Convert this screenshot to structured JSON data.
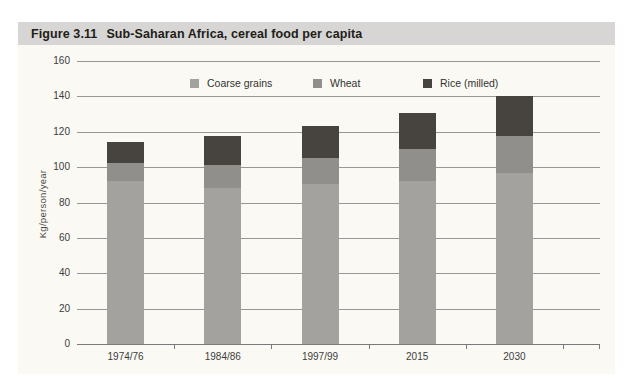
{
  "figure": {
    "label": "Figure 3.11",
    "title": "Sub-Saharan Africa, cereal food per capita"
  },
  "chart_data": {
    "type": "bar",
    "stacked": true,
    "title": "Sub-Saharan Africa, cereal food per capita",
    "xlabel": "",
    "ylabel": "Kg/person/year",
    "ylim": [
      0,
      160
    ],
    "ytick_step": 20,
    "grid": true,
    "legend_position": "top-center",
    "categories": [
      "1974/76",
      "1984/86",
      "1997/99",
      "2015",
      "2030"
    ],
    "series": [
      {
        "name": "Coarse grains",
        "color": "#a3a29e",
        "values": [
          93,
          89,
          91,
          93,
          97
        ]
      },
      {
        "name": "Wheat",
        "color": "#908f8b",
        "values": [
          10,
          13,
          15,
          18,
          21
        ]
      },
      {
        "name": "Rice (milled)",
        "color": "#474440",
        "values": [
          12,
          16,
          18,
          20,
          23
        ]
      }
    ],
    "stack_totals": [
      115,
      118,
      124,
      131,
      141
    ]
  },
  "colors": {
    "title_bar_bg": "#d7d6d4",
    "panel_bg": "#faf9f4",
    "gridline": "#979797",
    "axis": "#7a7a7a",
    "text": "#3c3c3c",
    "title_text": "#211d19"
  }
}
